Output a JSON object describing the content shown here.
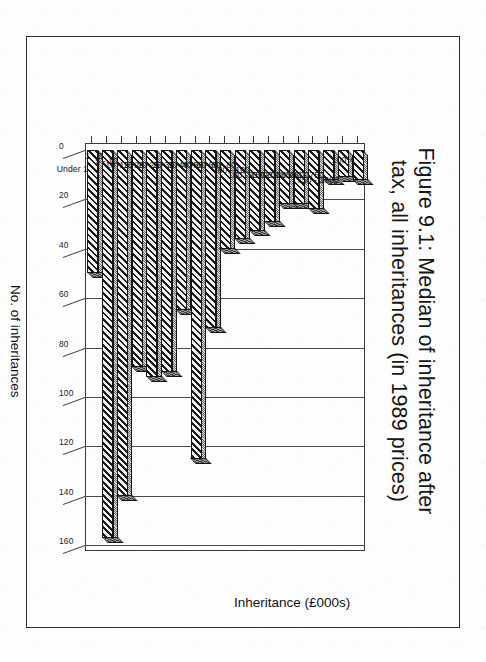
{
  "figure": {
    "title_line1": "Figure 9.1: Median of inheritance after",
    "title_line2": "tax, all inheritances (in 1989 prices)"
  },
  "axes": {
    "value_axis_title": "No. of inheritances",
    "category_axis_title": "Inheritance (£000s)"
  },
  "chart_data": {
    "type": "bar",
    "orientation": "horizontal",
    "title": "Figure 9.1: Median of inheritance after tax, all inheritances (in 1989 prices)",
    "xlabel": "Inheritance (£000s)",
    "ylabel": "No. of inheritances",
    "ylim": [
      0,
      160
    ],
    "yticks": [
      0,
      20,
      40,
      60,
      80,
      100,
      120,
      140,
      160
    ],
    "ytick_labels": [
      "0",
      "20",
      "40",
      "60",
      "80",
      "100",
      "120",
      "140",
      "160"
    ],
    "grid": true,
    "legend": false,
    "style": "3d-bars-hatched",
    "categories": [
      "Under 1",
      "1 - 5",
      "5 - 10",
      "10 - 15",
      "15 - 20",
      "20 - 25",
      "25 - 30",
      "30 - 40",
      "40 - 50",
      "50 - 60",
      "60 - 80",
      "80 - 100",
      "100 - 150",
      "150 - 200",
      "200 - 300",
      "300 - 500",
      "500 - 750",
      "750 - 1000",
      "100 +"
    ],
    "values": [
      50,
      157,
      140,
      88,
      92,
      90,
      65,
      125,
      72,
      40,
      36,
      33,
      29,
      22,
      22,
      24,
      12,
      11,
      12
    ]
  },
  "colors": {
    "ink": "#161616",
    "axis": "#3c3c3c",
    "paper": "#fdfdfd",
    "bar_dark": "#1b1b1b",
    "bar_light": "#f2f2f2"
  }
}
